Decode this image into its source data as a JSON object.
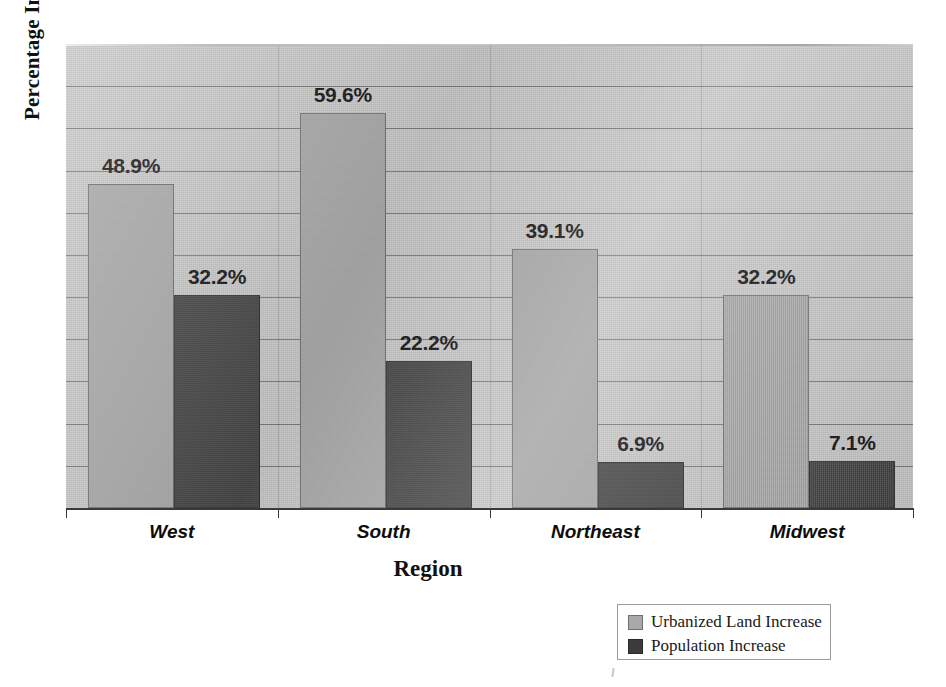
{
  "chart_data": {
    "type": "bar",
    "title": "",
    "xlabel": "Region",
    "ylabel": "Percentage Increase",
    "categories": [
      "West",
      "South",
      "Northeast",
      "Midwest"
    ],
    "series": [
      {
        "name": "Urbanized Land Increase",
        "color": "#a9a9a9",
        "values": [
          48.9,
          59.6,
          39.1,
          32.2
        ],
        "labels": [
          "48.9%",
          "59.6%",
          "39.1%",
          "32.2%"
        ]
      },
      {
        "name": "Population Increase",
        "color": "#3b3b3b",
        "values": [
          32.2,
          22.2,
          6.9,
          7.1
        ],
        "labels": [
          "32.2%",
          "22.2%",
          "6.9%",
          "7.1%"
        ]
      }
    ],
    "ylim": [
      0,
      70
    ],
    "gridlines": 10,
    "grid": true,
    "legend_position": "bottom-right",
    "plot_background": "#c9c9c9"
  },
  "axis": {
    "y_title": "Percentage Increase",
    "x_title": "Region"
  },
  "legend": {
    "items": [
      {
        "label": "Urbanized Land Increase",
        "swatch": "light"
      },
      {
        "label": "Population Increase",
        "swatch": "dark"
      }
    ]
  }
}
